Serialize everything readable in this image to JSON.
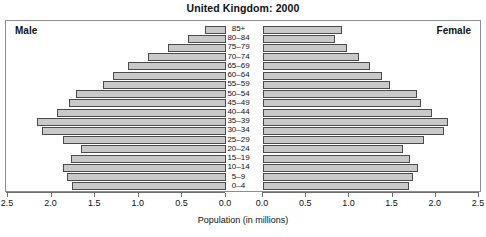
{
  "chart_data": {
    "type": "bar",
    "subtype": "population-pyramid",
    "title": "United Kingdom: 2000",
    "xlabel": "Population (in millions)",
    "ylabel": "",
    "grid": false,
    "legend_position": "inside-corners",
    "left_panel_label": "Male",
    "right_panel_label": "Female",
    "categories": [
      "85+",
      "80–84",
      "75–79",
      "70–74",
      "65–69",
      "60–64",
      "55–59",
      "50–54",
      "45–49",
      "40–44",
      "35–39",
      "30–34",
      "25–29",
      "20–24",
      "15–19",
      "10–14",
      "5–9",
      "0–4"
    ],
    "axis_max": 2.5,
    "left_axis_ticks": [
      2.5,
      2.0,
      1.5,
      1.0,
      0.5,
      0.0
    ],
    "right_axis_ticks": [
      0.0,
      0.5,
      1.0,
      1.5,
      2.0,
      2.5
    ],
    "series": [
      {
        "name": "Male",
        "side": "left",
        "values": [
          0.24,
          0.44,
          0.67,
          0.9,
          1.13,
          1.3,
          1.42,
          1.73,
          1.81,
          1.95,
          2.18,
          2.12,
          1.88,
          1.67,
          1.79,
          1.88,
          1.83,
          1.77
        ]
      },
      {
        "name": "Female",
        "side": "right",
        "values": [
          0.92,
          0.83,
          0.97,
          1.11,
          1.24,
          1.38,
          1.47,
          1.78,
          1.83,
          1.96,
          2.14,
          2.1,
          1.86,
          1.62,
          1.7,
          1.79,
          1.74,
          1.69
        ]
      }
    ]
  },
  "style": {
    "bar_fill": "#c9c9c9",
    "bar_stroke": "#4b4b4b",
    "frame_stroke": "#8d8d8d",
    "text_color": "#111111",
    "background": "#ffffff"
  }
}
